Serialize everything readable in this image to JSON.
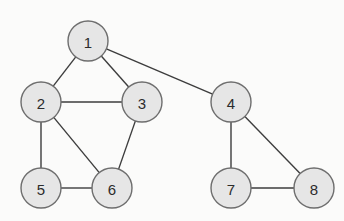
{
  "diagram": {
    "type": "undirected-graph",
    "node_radius": 20,
    "colors": {
      "background": "#fbfbfa",
      "node_fill": "#e6e6e6",
      "node_stroke": "#6e6e6e",
      "edge": "#3d3d3d",
      "label": "#2c2c2c"
    },
    "nodes": [
      {
        "id": "1",
        "label": "1",
        "x": 88,
        "y": 41
      },
      {
        "id": "2",
        "label": "2",
        "x": 41,
        "y": 102
      },
      {
        "id": "3",
        "label": "3",
        "x": 142,
        "y": 102
      },
      {
        "id": "4",
        "label": "4",
        "x": 231,
        "y": 102
      },
      {
        "id": "5",
        "label": "5",
        "x": 41,
        "y": 188
      },
      {
        "id": "6",
        "label": "6",
        "x": 112,
        "y": 188
      },
      {
        "id": "7",
        "label": "7",
        "x": 231,
        "y": 188
      },
      {
        "id": "8",
        "label": "8",
        "x": 314,
        "y": 188
      }
    ],
    "edges": [
      [
        "1",
        "2"
      ],
      [
        "1",
        "3"
      ],
      [
        "1",
        "4"
      ],
      [
        "2",
        "3"
      ],
      [
        "2",
        "5"
      ],
      [
        "2",
        "6"
      ],
      [
        "3",
        "6"
      ],
      [
        "5",
        "6"
      ],
      [
        "4",
        "7"
      ],
      [
        "4",
        "8"
      ],
      [
        "7",
        "8"
      ]
    ]
  }
}
